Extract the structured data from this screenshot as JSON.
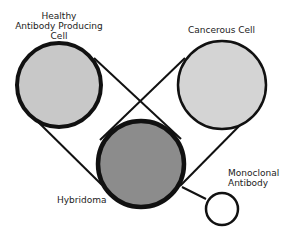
{
  "labels": {
    "healthy_cell": [
      "Healthy",
      "Antibody Producing",
      "Cell"
    ],
    "cancerous_cell": "Cancerous Cell",
    "hybridoma": "Hybridoma",
    "monoclonal_antibody": [
      "Monoclonal",
      "Antibody"
    ]
  },
  "colors": {
    "healthy_fill": "#c8c8c8",
    "cancerous_fill": "#d4d4d4",
    "hybridoma_fill": "#8c8c8c",
    "stroke": "#111111",
    "background": "#ffffff"
  }
}
